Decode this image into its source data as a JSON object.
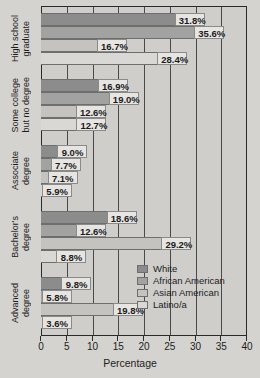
{
  "chart_data": {
    "type": "bar",
    "orientation": "horizontal",
    "title": "",
    "xlabel": "Percentage",
    "ylabel": "",
    "xlim": [
      0,
      40
    ],
    "xticks": [
      0,
      5,
      10,
      15,
      20,
      25,
      30,
      35,
      40
    ],
    "grid": true,
    "legend_position": "inside-right-lower",
    "categories": [
      "High school graduate",
      "Some college but no degree",
      "Associate degree",
      "Bachelor's degree",
      "Advanced degree"
    ],
    "category_lines": [
      [
        "High school",
        "graduate"
      ],
      [
        "Some college",
        "but no degree"
      ],
      [
        "Associate",
        "degree"
      ],
      [
        "Bachelor's",
        "degree"
      ],
      [
        "Advanced",
        "degree"
      ]
    ],
    "series": [
      {
        "name": "White",
        "color": "#8c8c8c",
        "values": [
          31.8,
          16.9,
          9.0,
          18.6,
          9.8
        ],
        "labels": [
          "31.8%",
          "16.9%",
          "9.0%",
          "18.6%",
          "9.8%"
        ]
      },
      {
        "name": "African American",
        "color": "#a2a2a0",
        "values": [
          35.6,
          19.0,
          7.7,
          12.6,
          5.8
        ],
        "labels": [
          "35.6%",
          "19.0%",
          "7.7%",
          "12.6%",
          "5.8%"
        ]
      },
      {
        "name": "Asian American",
        "color": "#c4c3c0",
        "values": [
          16.7,
          12.6,
          7.1,
          29.2,
          19.8
        ],
        "labels": [
          "16.7%",
          "12.6%",
          "7.1%",
          "29.2%",
          "19.8%"
        ]
      },
      {
        "name": "Latino/a",
        "color": "#d9d8d5",
        "values": [
          28.4,
          12.7,
          5.9,
          8.8,
          3.6
        ],
        "labels": [
          "28.4%",
          "12.7%",
          "5.9%",
          "8.8%",
          "3.6%"
        ]
      }
    ]
  }
}
